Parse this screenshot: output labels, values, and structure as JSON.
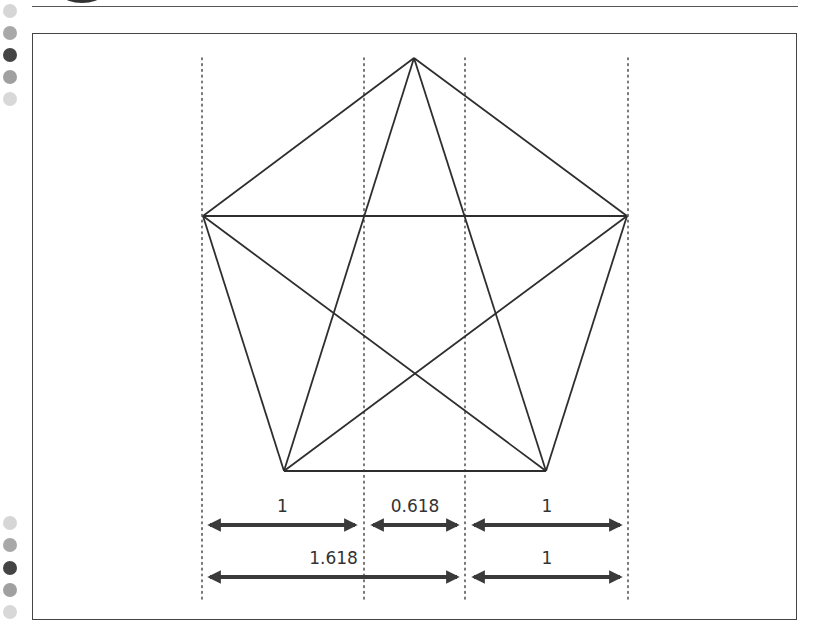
{
  "side_dots_top": [
    {
      "y": 11,
      "color": "#d6d6d6"
    },
    {
      "y": 33,
      "color": "#a8a8a8"
    },
    {
      "y": 55,
      "color": "#444444"
    },
    {
      "y": 77,
      "color": "#a0a0a0"
    },
    {
      "y": 99,
      "color": "#d8d8d8"
    }
  ],
  "side_dots_bottom": [
    {
      "y": 523,
      "color": "#d6d6d6"
    },
    {
      "y": 545,
      "color": "#a8a8a8"
    },
    {
      "y": 568,
      "color": "#444444"
    },
    {
      "y": 590,
      "color": "#a0a0a0"
    },
    {
      "y": 612,
      "color": "#d8d8d8"
    }
  ],
  "diagram": {
    "vertices": {
      "top": [
        414,
        58
      ],
      "left": [
        203,
        216
      ],
      "right": [
        627,
        216
      ],
      "bottom_left": [
        284,
        471
      ],
      "bottom_right": [
        546,
        471
      ]
    },
    "guide_lines_x": [
      202,
      364,
      465,
      628
    ],
    "guide_lines_y": [
      58,
      600
    ],
    "row1": [
      {
        "label": "1",
        "x1": 204,
        "x2": 361
      },
      {
        "label": "0.618",
        "x1": 367,
        "x2": 463
      },
      {
        "label": "1",
        "x1": 468,
        "x2": 626
      }
    ],
    "row2": [
      {
        "label": "1.618",
        "x1": 204,
        "x2": 463
      },
      {
        "label": "1",
        "x1": 468,
        "x2": 626
      }
    ]
  }
}
